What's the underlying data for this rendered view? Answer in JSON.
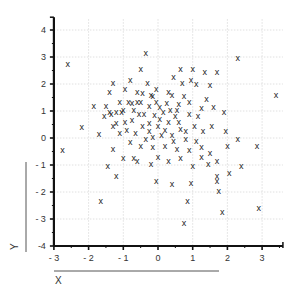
{
  "chart_data": {
    "type": "scatter",
    "title": "",
    "xlabel": "X",
    "ylabel": "Y",
    "marker": "x",
    "xlim": [
      -3,
      3.6
    ],
    "ylim": [
      -4,
      4.4
    ],
    "xticks": [
      -3,
      -2,
      -1,
      0,
      1,
      2,
      3
    ],
    "yticks": [
      -4,
      -3,
      -2,
      -1,
      0,
      1,
      2,
      3,
      4
    ],
    "xtick_labels": [
      "- 3",
      "- 2",
      "- 1",
      "0",
      "1",
      "2",
      "3"
    ],
    "ytick_labels": [
      "-4",
      "- 3",
      "- 2",
      "- 1",
      "0",
      "1",
      "2",
      "3",
      "4"
    ],
    "grid": true,
    "legend": null,
    "points": [
      {
        "x": -2.6,
        "y": 2.75
      },
      {
        "x": -2.75,
        "y": -0.45
      },
      {
        "x": -2.2,
        "y": 0.4
      },
      {
        "x": -1.65,
        "y": -2.35
      },
      {
        "x": -1.45,
        "y": -1.05
      },
      {
        "x": -1.2,
        "y": -1.4
      },
      {
        "x": -1.0,
        "y": -0.75
      },
      {
        "x": -1.3,
        "y": -0.4
      },
      {
        "x": -0.6,
        "y": -0.85
      },
      {
        "x": -0.7,
        "y": -0.75
      },
      {
        "x": -1.7,
        "y": 0.15
      },
      {
        "x": -1.55,
        "y": 0.8
      },
      {
        "x": -1.5,
        "y": 1.2
      },
      {
        "x": -1.85,
        "y": 1.2
      },
      {
        "x": -1.2,
        "y": 0.95
      },
      {
        "x": -1.35,
        "y": 0.9
      },
      {
        "x": -1.3,
        "y": 0.45
      },
      {
        "x": -1.2,
        "y": 0.55
      },
      {
        "x": -1.4,
        "y": 1.7
      },
      {
        "x": -1.3,
        "y": 2.05
      },
      {
        "x": -1.1,
        "y": 1.35
      },
      {
        "x": -0.95,
        "y": 1.8
      },
      {
        "x": -0.8,
        "y": 2.15
      },
      {
        "x": -0.5,
        "y": 2.55
      },
      {
        "x": -0.6,
        "y": 1.7
      },
      {
        "x": -0.3,
        "y": 2.05
      },
      {
        "x": -0.35,
        "y": 3.15
      },
      {
        "x": -1.05,
        "y": 0.95
      },
      {
        "x": -0.9,
        "y": 0.3
      },
      {
        "x": -0.75,
        "y": 0.65
      },
      {
        "x": -0.55,
        "y": 0.9
      },
      {
        "x": -0.5,
        "y": 1.35
      },
      {
        "x": -0.25,
        "y": 1.2
      },
      {
        "x": -0.15,
        "y": 1.55
      },
      {
        "x": -0.05,
        "y": 1.8
      },
      {
        "x": 0.05,
        "y": 1.15
      },
      {
        "x": -0.65,
        "y": 0.2
      },
      {
        "x": -0.45,
        "y": 0.45
      },
      {
        "x": -0.25,
        "y": 0.55
      },
      {
        "x": -0.1,
        "y": 0.85
      },
      {
        "x": 0.0,
        "y": 0.45
      },
      {
        "x": 0.15,
        "y": 0.95
      },
      {
        "x": 0.25,
        "y": 1.3
      },
      {
        "x": 0.3,
        "y": 0.6
      },
      {
        "x": 0.4,
        "y": 1.6
      },
      {
        "x": 0.5,
        "y": 0.8
      },
      {
        "x": 0.6,
        "y": 1.25
      },
      {
        "x": 0.7,
        "y": 2.05
      },
      {
        "x": 0.65,
        "y": 2.55
      },
      {
        "x": 0.45,
        "y": 2.25
      },
      {
        "x": 0.75,
        "y": 1.55
      },
      {
        "x": 0.9,
        "y": 0.9
      },
      {
        "x": 0.95,
        "y": 2.15
      },
      {
        "x": 1.0,
        "y": 2.55
      },
      {
        "x": 1.1,
        "y": 2.0
      },
      {
        "x": 1.35,
        "y": 2.45
      },
      {
        "x": 1.7,
        "y": 2.45
      },
      {
        "x": 1.5,
        "y": 1.95
      },
      {
        "x": 1.25,
        "y": 1.1
      },
      {
        "x": 1.6,
        "y": 1.15
      },
      {
        "x": 1.9,
        "y": 0.95
      },
      {
        "x": 2.3,
        "y": 2.95
      },
      {
        "x": 3.4,
        "y": 1.6
      },
      {
        "x": -0.15,
        "y": 0.05
      },
      {
        "x": -0.35,
        "y": -0.05
      },
      {
        "x": 0.2,
        "y": -0.3
      },
      {
        "x": 0.4,
        "y": 0.1
      },
      {
        "x": 0.65,
        "y": 0.35
      },
      {
        "x": 0.8,
        "y": -0.05
      },
      {
        "x": 1.05,
        "y": 0.45
      },
      {
        "x": 1.3,
        "y": 0.25
      },
      {
        "x": 1.55,
        "y": 0.45
      },
      {
        "x": 1.95,
        "y": 0.25
      },
      {
        "x": 2.3,
        "y": -0.05
      },
      {
        "x": 1.1,
        "y": -0.1
      },
      {
        "x": 0.55,
        "y": -0.4
      },
      {
        "x": 0.9,
        "y": -0.45
      },
      {
        "x": 1.25,
        "y": -0.35
      },
      {
        "x": 1.5,
        "y": -0.55
      },
      {
        "x": 1.7,
        "y": -0.85
      },
      {
        "x": 2.0,
        "y": -0.3
      },
      {
        "x": 2.85,
        "y": -0.3
      },
      {
        "x": 2.4,
        "y": -1.05
      },
      {
        "x": 1.7,
        "y": -1.4
      },
      {
        "x": 2.05,
        "y": -1.3
      },
      {
        "x": 1.7,
        "y": -1.6
      },
      {
        "x": 1.75,
        "y": -1.95
      },
      {
        "x": 1.85,
        "y": -2.75
      },
      {
        "x": 2.9,
        "y": -2.6
      },
      {
        "x": 0.85,
        "y": -2.35
      },
      {
        "x": 0.75,
        "y": -3.15
      },
      {
        "x": 0.95,
        "y": -1.65
      },
      {
        "x": 0.4,
        "y": -1.7
      },
      {
        "x": -0.05,
        "y": -1.6
      },
      {
        "x": 0.0,
        "y": -0.7
      },
      {
        "x": 0.3,
        "y": -0.85
      },
      {
        "x": -0.2,
        "y": -0.95
      },
      {
        "x": 1.0,
        "y": -1.05
      },
      {
        "x": 1.45,
        "y": -0.95
      },
      {
        "x": -0.85,
        "y": 1.35
      },
      {
        "x": -0.7,
        "y": 1.05
      },
      {
        "x": -0.4,
        "y": 0.9
      },
      {
        "x": 0.05,
        "y": 0.7
      },
      {
        "x": 0.2,
        "y": 0.3
      },
      {
        "x": 0.35,
        "y": 1.05
      },
      {
        "x": 0.55,
        "y": 1.05
      },
      {
        "x": -0.05,
        "y": 1.35
      },
      {
        "x": -0.6,
        "y": 1.35
      },
      {
        "x": -0.95,
        "y": 0.6
      },
      {
        "x": -1.1,
        "y": 0.2
      },
      {
        "x": -0.8,
        "y": -0.15
      },
      {
        "x": -0.5,
        "y": -0.3
      },
      {
        "x": -0.25,
        "y": 0.25
      },
      {
        "x": 0.1,
        "y": 0.1
      },
      {
        "x": 0.6,
        "y": 0.6
      },
      {
        "x": 0.8,
        "y": 0.25
      },
      {
        "x": 1.15,
        "y": 0.8
      },
      {
        "x": 1.4,
        "y": 1.45
      },
      {
        "x": 0.9,
        "y": 1.35
      },
      {
        "x": 0.3,
        "y": 1.7
      },
      {
        "x": -0.2,
        "y": 1.6
      },
      {
        "x": -0.45,
        "y": 1.65
      },
      {
        "x": -0.75,
        "y": 1.3
      },
      {
        "x": -1.0,
        "y": 1.05
      },
      {
        "x": -1.4,
        "y": 0.95
      },
      {
        "x": 0.45,
        "y": -0.1
      },
      {
        "x": -0.15,
        "y": -0.35
      },
      {
        "x": 0.65,
        "y": -0.75
      },
      {
        "x": 1.25,
        "y": -0.7
      }
    ]
  },
  "axes": {
    "x_title": "X",
    "y_title": "Y"
  }
}
